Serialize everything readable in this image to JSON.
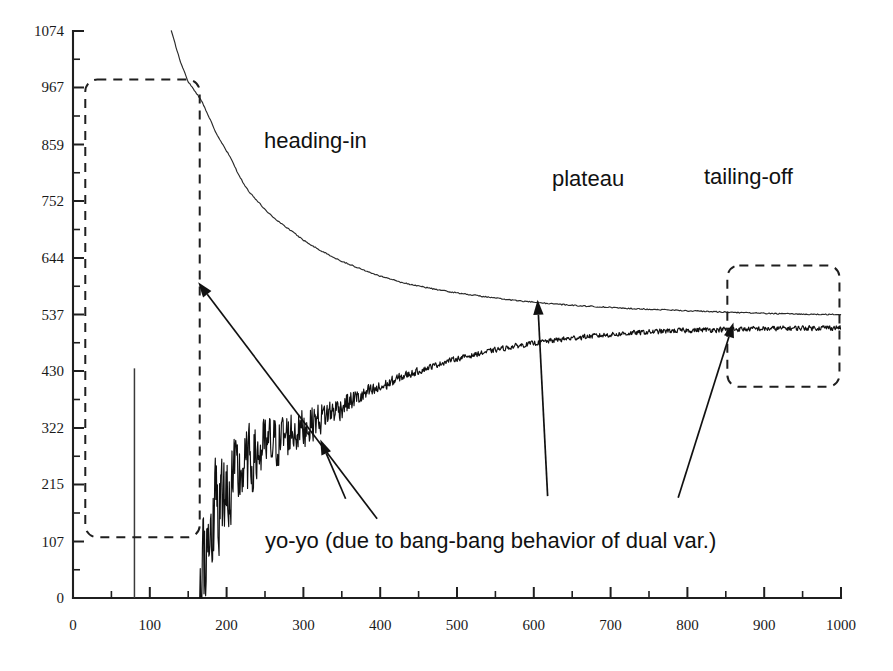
{
  "figure": {
    "background_color": "#ffffff",
    "ink_color": "#1a1a1a"
  },
  "chart_data": {
    "type": "line",
    "title": "",
    "xlabel": "",
    "ylabel": "",
    "xlim": [
      0,
      1000
    ],
    "ylim": [
      0,
      1074
    ],
    "grid": false,
    "legend_position": "none",
    "x_ticks": [
      0,
      100,
      200,
      300,
      400,
      500,
      600,
      700,
      800,
      900,
      1000
    ],
    "x_tick_labels": [
      "0",
      "100",
      "200",
      "300",
      "400",
      "500",
      "600",
      "700",
      "800",
      "900",
      "1000"
    ],
    "x_minor_tick_step": 50,
    "y_ticks": [
      0,
      107,
      215,
      322,
      430,
      537,
      644,
      752,
      859,
      967,
      1074
    ],
    "y_tick_labels": [
      "0",
      "107",
      "215",
      "322",
      "430",
      "537",
      "644",
      "752",
      "859",
      "967",
      "1074"
    ],
    "y_minor_tick_step": 53.7,
    "series": [
      {
        "name": "upper-bound",
        "note": "monotone decreasing curve converging to plateau near 537",
        "x": [
          128,
          140,
          150,
          160,
          168,
          176,
          185,
          196,
          206,
          216,
          228,
          240,
          252,
          265,
          280,
          300,
          320,
          345,
          370,
          400,
          430,
          460,
          490,
          520,
          550,
          580,
          610,
          645,
          680,
          715,
          750,
          785,
          820,
          860,
          900,
          940,
          975,
          1000
        ],
        "y": [
          1074,
          1015,
          978,
          958,
          940,
          915,
          884,
          856,
          832,
          800,
          772,
          752,
          733,
          716,
          700,
          678,
          660,
          641,
          626,
          610,
          597,
          588,
          580,
          574,
          568,
          563,
          559,
          555,
          552,
          549,
          547,
          545,
          543,
          541,
          539,
          538,
          537,
          537
        ]
      },
      {
        "name": "lower-bound",
        "note": "noisy increasing curve with yo-yo oscillation converging to about 510",
        "x": [
          165,
          172,
          180,
          190,
          200,
          212,
          225,
          240,
          255,
          270,
          285,
          300,
          320,
          340,
          360,
          380,
          400,
          430,
          460,
          490,
          520,
          550,
          580,
          620,
          660,
          700,
          740,
          780,
          820,
          860,
          900,
          940,
          975,
          1000
        ],
        "y": [
          0,
          95,
          150,
          175,
          205,
          225,
          250,
          272,
          288,
          300,
          315,
          322,
          340,
          355,
          372,
          385,
          398,
          420,
          435,
          450,
          460,
          470,
          478,
          487,
          494,
          499,
          503,
          506,
          508,
          509,
          510,
          511,
          512,
          512
        ],
        "noise_amplitude_start": 120,
        "noise_amplitude_end": 6
      },
      {
        "name": "initial-spike",
        "note": "isolated vertical spike rising from baseline",
        "x": [
          80,
          80
        ],
        "y": [
          0,
          435
        ]
      }
    ],
    "annotations": [
      {
        "id": "heading-in",
        "text": "heading-in",
        "label_x": 396,
        "label_y": 150,
        "target_x": 163,
        "target_y": 598
      },
      {
        "id": "plateau",
        "text": "plateau",
        "label_x": 618,
        "label_y": 193,
        "target_x": 605,
        "target_y": 565
      },
      {
        "id": "tailing-off",
        "text": "tailing-off",
        "label_x": 788,
        "label_y": 190,
        "target_x": 860,
        "target_y": 522
      },
      {
        "id": "yo-yo",
        "text": "yo-yo (due to bang-bang behavior of dual var.)",
        "label_x": 355,
        "label_y": 188,
        "target_x": 322,
        "target_y": 300
      }
    ],
    "highlight_boxes": [
      {
        "id": "heading-in-box",
        "x0": 16,
        "y0": 115,
        "x1": 165,
        "y1": 982
      },
      {
        "id": "tailing-off-box",
        "x0": 852,
        "y0": 400,
        "x1": 998,
        "y1": 630
      }
    ]
  },
  "labels": {
    "heading_in": "heading-in",
    "plateau": "plateau",
    "tailing_off": "tailing-off",
    "yo_yo": "yo-yo (due to bang-bang behavior of dual var.)"
  }
}
